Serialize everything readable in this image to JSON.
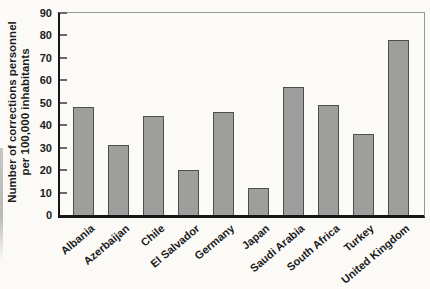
{
  "chart_data": {
    "type": "bar",
    "title": "",
    "xlabel": "",
    "ylabel_lines": [
      "Number of corrections personnel",
      "per 100,000 inhabitants"
    ],
    "categories": [
      "Albania",
      "Azerbaijan",
      "Chile",
      "El Salvador",
      "Germany",
      "Japan",
      "Saudi Arabia",
      "South Africa",
      "Turkey",
      "United Kingdom"
    ],
    "values": [
      48,
      31,
      44,
      20,
      46,
      12,
      57,
      49,
      36,
      78
    ],
    "ylim": [
      0,
      90
    ],
    "yticks": [
      0,
      10,
      20,
      30,
      40,
      50,
      60,
      70,
      80,
      90
    ],
    "grid": false,
    "legend": "none",
    "bar_fill": "#9e9e9c",
    "bar_border": "#4e4e4e"
  },
  "colors": {
    "background": "#fbfaf6",
    "axis": "#161616",
    "frame": "#97979a",
    "tick": "#6a6a6a",
    "text": "#1c1c1c"
  }
}
